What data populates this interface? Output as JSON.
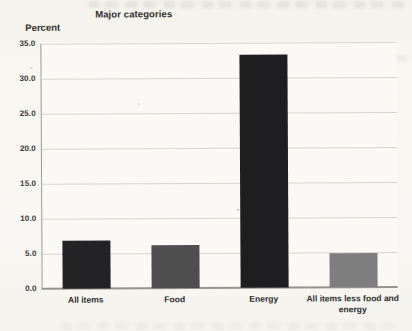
{
  "chart_data": {
    "type": "bar",
    "title": "Major categories",
    "ylabel": "Percent",
    "xlabel": "",
    "categories": [
      "All items",
      "Food",
      "Energy",
      "All items less food and energy"
    ],
    "values": [
      6.8,
      6.1,
      33.3,
      4.9
    ],
    "ylim": [
      0,
      35
    ],
    "ytick_step": 5,
    "ytick_labels": [
      "0.0",
      "5.0",
      "10.0",
      "15.0",
      "20.0",
      "25.0",
      "30.0",
      "35.0"
    ],
    "grid": true,
    "legend_position": "none",
    "bar_colors": [
      "#232325",
      "#4e4e4f",
      "#1e1e20",
      "#7e7e7f"
    ],
    "background_color": "#f7f6f1",
    "gridline_color": "#d6d5cf",
    "axis_color": "#94938e",
    "text_color": "#2e2d2b"
  }
}
